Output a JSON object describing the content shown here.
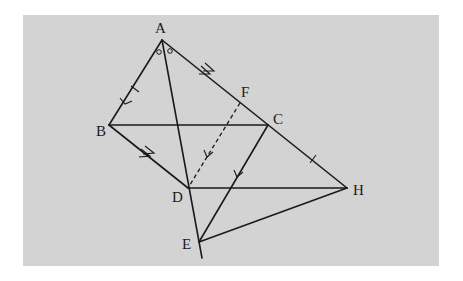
{
  "diagram": {
    "type": "geometry",
    "background_color": "#d3d3d3",
    "line_color": "#1a1a1a",
    "points": [
      {
        "id": "A",
        "label": "A"
      },
      {
        "id": "B",
        "label": "B"
      },
      {
        "id": "C",
        "label": "C"
      },
      {
        "id": "D",
        "label": "D"
      },
      {
        "id": "E",
        "label": "E"
      },
      {
        "id": "F",
        "label": "F"
      },
      {
        "id": "H",
        "label": "H"
      }
    ],
    "segments": [
      {
        "from": "A",
        "to": "B",
        "style": "solid",
        "marks": [
          "tick",
          "arrow-single"
        ]
      },
      {
        "from": "A",
        "to": "H",
        "style": "solid",
        "through": [
          "F",
          "C"
        ],
        "marks": [
          "arrow-double",
          "tick"
        ]
      },
      {
        "from": "B",
        "to": "C",
        "style": "solid",
        "marks": []
      },
      {
        "from": "B",
        "to": "D",
        "style": "solid",
        "marks": [
          "arrow-double"
        ]
      },
      {
        "from": "A",
        "to": "E",
        "style": "solid",
        "through": [
          "D"
        ],
        "extends_beyond": "E",
        "marks": []
      },
      {
        "from": "C",
        "to": "E",
        "style": "solid",
        "marks": [
          "arrow-single"
        ]
      },
      {
        "from": "D",
        "to": "H",
        "style": "solid",
        "marks": []
      },
      {
        "from": "E",
        "to": "H",
        "style": "solid",
        "marks": []
      },
      {
        "from": "F",
        "to": "D",
        "style": "dashed",
        "marks": [
          "arrow-single"
        ]
      }
    ],
    "angle_marks": [
      {
        "vertex": "A",
        "description": "equal angles BAD and DAE-side CAD marked with small circles",
        "count": 2
      }
    ]
  }
}
